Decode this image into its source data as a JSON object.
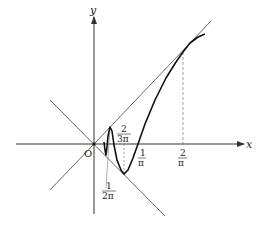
{
  "diagram": {
    "type": "function-graph",
    "axes": {
      "x_label": "x",
      "y_label": "y",
      "origin_label": "O"
    },
    "curve": "y = x sin(1/x)",
    "bounding_lines": [
      "y = x",
      "y = -x"
    ],
    "tick_labels": [
      {
        "id": "t1",
        "num": "1",
        "den": "2π"
      },
      {
        "id": "t2",
        "num": "2",
        "den": "3π"
      },
      {
        "id": "t3",
        "num": "1",
        "den": "π"
      },
      {
        "id": "t4",
        "num": "2",
        "den": "π"
      }
    ],
    "colors": {
      "curve": "#111111",
      "lines": "#444444",
      "axes": "#333333"
    }
  }
}
